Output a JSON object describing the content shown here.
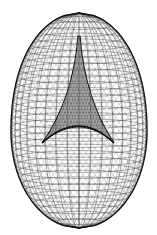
{
  "figure": {
    "background": "#ffffff",
    "stroke_color": "#1a1a1a",
    "outline_color": "#111111",
    "cusp_fill": "#3a3a3a",
    "shape": {
      "center_x": 79,
      "top_y": 13,
      "bottom_y": 228,
      "half_width": 68,
      "widest_y": 132
    },
    "cusp": {
      "apex": [
        79,
        36
      ],
      "left": [
        42,
        143
      ],
      "right": [
        114,
        143
      ]
    },
    "mesh": {
      "meridians": 36,
      "parallels": 34
    }
  }
}
